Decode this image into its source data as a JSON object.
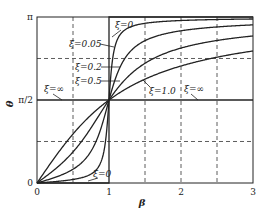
{
  "chart_data": {
    "type": "line",
    "title": "",
    "xlabel": "β",
    "ylabel": "θ",
    "xlim": [
      0,
      3
    ],
    "ylim": [
      0,
      3.14159
    ],
    "x_ticks": [
      {
        "value": 0,
        "label": "0"
      },
      {
        "value": 1,
        "label": "1"
      },
      {
        "value": 2,
        "label": "2"
      },
      {
        "value": 3,
        "label": "3"
      }
    ],
    "y_ticks": [
      {
        "value": 0,
        "label": "0"
      },
      {
        "value": 1.5708,
        "label": "π/2"
      },
      {
        "value": 3.14159,
        "label": "π"
      }
    ],
    "grid": {
      "style": "dashed",
      "x": [
        0.5,
        1.5,
        2,
        2.5
      ],
      "y": [
        0.7854,
        2.3562
      ]
    },
    "formula": "θ = atan2(2ξβ, 1 − β²)",
    "series": [
      {
        "name": "ξ=0",
        "zeta": 0
      },
      {
        "name": "ξ=0.05",
        "zeta": 0.05
      },
      {
        "name": "ξ=0.2",
        "zeta": 0.2
      },
      {
        "name": "ξ=0.5",
        "zeta": 0.5
      },
      {
        "name": "ξ=1.0",
        "zeta": 1.0
      },
      {
        "name": "ξ=∞",
        "zeta": "inf"
      }
    ],
    "annotations": [
      {
        "text": "ξ=0",
        "x": 115,
        "y": 28,
        "lx1": 121,
        "ly1": 30,
        "lx2": 112,
        "ly2": 37
      },
      {
        "text": "ξ=0.05",
        "x": 69,
        "y": 47,
        "lx1": 100,
        "ly1": 44,
        "lx2": 114,
        "ly2": 47
      },
      {
        "text": "ξ=0.2",
        "x": 75,
        "y": 70,
        "lx1": 101,
        "ly1": 67,
        "lx2": 120,
        "ly2": 67
      },
      {
        "text": "ξ=0.5",
        "x": 75,
        "y": 84,
        "lx1": 101,
        "ly1": 81,
        "lx2": 120,
        "ly2": 81
      },
      {
        "text": "ξ=∞",
        "x": 44,
        "y": 92,
        "lx1": 53,
        "ly1": 94,
        "lx2": 62,
        "ly2": 100
      },
      {
        "text": "ξ=1.0",
        "x": 149,
        "y": 94,
        "lx1": 150,
        "ly1": 87,
        "lx2": 143,
        "ly2": 80
      },
      {
        "text": "ξ=∞",
        "x": 184,
        "y": 92,
        "lx1": 191,
        "ly1": 94,
        "lx2": 198,
        "ly2": 100
      },
      {
        "text": "ξ=0",
        "x": 93,
        "y": 177,
        "lx1": 98,
        "ly1": 178,
        "lx2": 88,
        "ly2": 181
      }
    ]
  },
  "frame": {
    "x0": 37,
    "x1": 253,
    "y0": 183,
    "y1": 17
  },
  "colors": {
    "line": "#222222",
    "grid": "#333333",
    "background": "#ffffff"
  }
}
